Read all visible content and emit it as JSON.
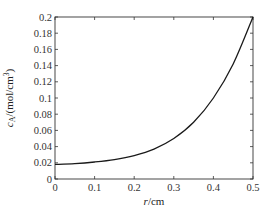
{
  "chart_data": {
    "type": "line",
    "title": "",
    "xlabel": "r/cm",
    "ylabel": "c_A/(mol/cm³)",
    "xlim": [
      0,
      0.5
    ],
    "ylim": [
      0,
      0.2
    ],
    "x_ticks": [
      "0",
      "0.1",
      "0.2",
      "0.3",
      "0.4",
      "0.5"
    ],
    "y_ticks": [
      "0",
      "0.02",
      "0.04",
      "0.06",
      "0.08",
      "0.1",
      "0.12",
      "0.14",
      "0.16",
      "0.18",
      "0.2"
    ],
    "grid": false,
    "legend": null,
    "series": [
      {
        "name": "c_A",
        "color": "#1a1a1a",
        "x": [
          0,
          0.05,
          0.1,
          0.15,
          0.2,
          0.25,
          0.3,
          0.35,
          0.4,
          0.45,
          0.5
        ],
        "y": [
          0.018,
          0.019,
          0.021,
          0.024,
          0.029,
          0.037,
          0.05,
          0.07,
          0.1,
          0.142,
          0.2
        ]
      }
    ]
  },
  "labels": {
    "xlabel_italic": "r",
    "xlabel_unit": "/cm",
    "ylabel_italic": "c",
    "ylabel_sub": "A",
    "ylabel_unit": "/(mol/cm",
    "ylabel_sup": "3",
    "ylabel_close": ")"
  }
}
